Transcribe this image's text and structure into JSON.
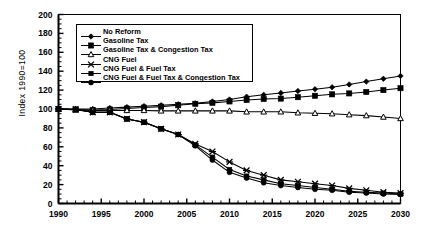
{
  "chart_data": {
    "type": "line",
    "title": "",
    "xlabel": "",
    "ylabel": "Index 1990=100",
    "xlim": [
      1990,
      2030
    ],
    "ylim": [
      0,
      200
    ],
    "ytick_step": 20,
    "xtick_step": 5,
    "xminor_step": 1,
    "grid": false,
    "legend_position": "top-left inside",
    "ytick_labels": [
      "0",
      "20",
      "40",
      "60",
      "80",
      "100",
      "120",
      "140",
      "160",
      "180",
      "200"
    ],
    "xtick_labels": [
      "1990",
      "1995",
      "2000",
      "2005",
      "2010",
      "2015",
      "2020",
      "2025",
      "2030"
    ],
    "x": [
      1990,
      1992,
      1994,
      1996,
      1998,
      2000,
      2002,
      2004,
      2006,
      2008,
      2010,
      2012,
      2014,
      2016,
      2018,
      2020,
      2022,
      2024,
      2026,
      2028,
      2030
    ],
    "series": [
      {
        "name": "No Reform",
        "marker": "diamond",
        "values": [
          100,
          100,
          100,
          101,
          102,
          103,
          104,
          105,
          106,
          108,
          110,
          113,
          115,
          117,
          119,
          121,
          123,
          126,
          129,
          132,
          135
        ]
      },
      {
        "name": "Gasoline Tax",
        "marker": "filled-square",
        "values": [
          100,
          99.5,
          99,
          99.5,
          100.5,
          101.5,
          102.5,
          104,
          105.5,
          106.5,
          108,
          109.5,
          110.5,
          111,
          112.5,
          114,
          115.5,
          116.5,
          118,
          120,
          122
        ]
      },
      {
        "name": "Gasoline Tax & Congestion Tax",
        "marker": "open-triangle",
        "values": [
          100,
          99,
          98.5,
          98.5,
          98.5,
          98.5,
          98,
          98,
          98,
          98,
          98,
          97,
          97,
          97,
          96,
          95.5,
          95,
          94,
          93,
          91.5,
          90
        ]
      },
      {
        "name": "CNG Fuel",
        "marker": "x-cross",
        "values": [
          100,
          99.5,
          96.5,
          96.5,
          89.5,
          86,
          79,
          73,
          63,
          55,
          44,
          35,
          30,
          25,
          23,
          21,
          19,
          16,
          14,
          12,
          11
        ]
      },
      {
        "name": "CNG Fuel & Fuel Tax",
        "marker": "filled-square-small",
        "values": [
          100,
          99.5,
          96.5,
          96.5,
          89.5,
          86,
          79,
          73,
          62,
          49,
          36,
          29,
          25,
          21,
          19,
          17,
          15,
          13,
          12,
          11,
          10
        ]
      },
      {
        "name": "CNG Fuel & Fuel Tax & Congestion Tax",
        "marker": "filled-circle",
        "values": [
          100,
          99.5,
          96.5,
          96.5,
          89.5,
          86,
          79,
          73,
          61,
          46,
          33,
          27,
          22,
          19,
          17,
          15,
          14,
          12,
          11,
          10,
          9.5
        ]
      }
    ]
  },
  "legend": {
    "items": [
      {
        "label": "No Reform",
        "marker": "diamond"
      },
      {
        "label": "Gasoline Tax",
        "marker": "filled-square"
      },
      {
        "label": "Gasoline Tax & Congestion Tax",
        "marker": "open-triangle"
      },
      {
        "label": "CNG Fuel",
        "marker": "x-cross"
      },
      {
        "label": "CNG Fuel & Fuel Tax",
        "marker": "filled-square-small"
      },
      {
        "label": "CNG Fuel & Fuel Tax & Congestion Tax",
        "marker": "filled-circle"
      }
    ]
  },
  "colors": {
    "line": "#000000",
    "axis": "#000000",
    "background": "#ffffff"
  }
}
